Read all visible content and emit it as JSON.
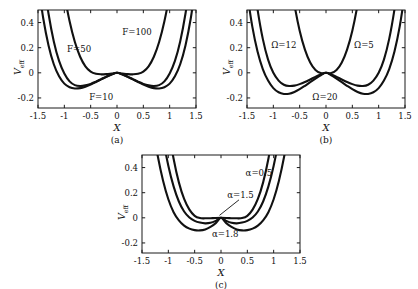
{
  "figure": {
    "background_color": "#ffffff",
    "curve_color": "#111111",
    "axis_color": "#1a1a1a",
    "xlabel": "X",
    "ylabel_main": "V",
    "ylabel_sub": "eff"
  },
  "chart_data": [
    {
      "type": "line",
      "panel": "a",
      "caption": "(a)",
      "title": "",
      "xlabel": "X",
      "ylabel": "V_eff",
      "xlim": [
        -1.5,
        1.5
      ],
      "ylim": [
        -0.28,
        0.5
      ],
      "xticks": [
        -1.5,
        -1,
        -0.5,
        0,
        0.5,
        1,
        1.5
      ],
      "xticklabels": [
        "-1.5",
        "-1",
        "-0.5",
        "0",
        "0.5",
        "1",
        "1.5"
      ],
      "yticks": [
        -0.2,
        0,
        0.2,
        0.4
      ],
      "yticklabels": [
        "-0.2",
        "0",
        "0.2",
        "0.4"
      ],
      "grid": false,
      "legend_position": "inline-annotations",
      "annotations": [
        {
          "text": "F=100",
          "x": 0.38,
          "y": 0.3
        },
        {
          "text": "F=50",
          "x": -0.72,
          "y": 0.165
        },
        {
          "text": "F=10",
          "x": -0.3,
          "y": -0.215
        }
      ],
      "series": [
        {
          "name": "F=10",
          "well_depth": -0.232,
          "well_position": 0.9,
          "x": [
            -1.5,
            -1.4,
            -1.3,
            -1.2,
            -1.1,
            -1.0,
            -0.9,
            -0.8,
            -0.7,
            -0.6,
            -0.5,
            -0.4,
            -0.3,
            -0.2,
            -0.1,
            0.0,
            0.1,
            0.2,
            0.3,
            0.4,
            0.5,
            0.6,
            0.7,
            0.8,
            0.9,
            1.0,
            1.1,
            1.2,
            1.3,
            1.4,
            1.5
          ],
          "values": [
            0.72,
            0.432,
            0.218,
            0.068,
            -0.028,
            -0.086,
            -0.115,
            -0.125,
            -0.122,
            -0.11,
            -0.093,
            -0.073,
            -0.052,
            -0.031,
            -0.013,
            0.0,
            -0.013,
            -0.031,
            -0.052,
            -0.073,
            -0.093,
            -0.11,
            -0.122,
            -0.125,
            -0.115,
            -0.086,
            -0.028,
            0.068,
            0.218,
            0.432,
            0.72
          ]
        },
        {
          "name": "F=50",
          "well_depth": -0.105,
          "well_position": 0.8,
          "x": [
            -1.5,
            -1.4,
            -1.3,
            -1.2,
            -1.1,
            -1.0,
            -0.9,
            -0.8,
            -0.7,
            -0.6,
            -0.5,
            -0.4,
            -0.3,
            -0.2,
            -0.1,
            0.0,
            0.1,
            0.2,
            0.3,
            0.4,
            0.5,
            0.6,
            0.7,
            0.8,
            0.9,
            1.0,
            1.1,
            1.2,
            1.3,
            1.4,
            1.5
          ],
          "values": [
            1.12,
            0.76,
            0.47,
            0.25,
            0.095,
            -0.005,
            -0.068,
            -0.098,
            -0.105,
            -0.1,
            -0.088,
            -0.07,
            -0.05,
            -0.03,
            -0.012,
            0.0,
            -0.012,
            -0.03,
            -0.05,
            -0.07,
            -0.088,
            -0.1,
            -0.105,
            -0.098,
            -0.068,
            -0.005,
            0.095,
            0.25,
            0.47,
            0.76,
            1.12
          ]
        },
        {
          "name": "F=100",
          "well_depth": -0.012,
          "well_position": 0.45,
          "x": [
            -1.5,
            -1.4,
            -1.3,
            -1.2,
            -1.1,
            -1.0,
            -0.9,
            -0.8,
            -0.7,
            -0.6,
            -0.5,
            -0.4,
            -0.3,
            -0.2,
            -0.1,
            0.0,
            0.1,
            0.2,
            0.3,
            0.4,
            0.5,
            0.6,
            0.7,
            0.8,
            0.9,
            1.0,
            1.1,
            1.2,
            1.3,
            1.4,
            1.5
          ],
          "values": [
            2.6,
            2.1,
            1.65,
            1.25,
            0.91,
            0.63,
            0.41,
            0.245,
            0.128,
            0.052,
            0.01,
            -0.008,
            -0.012,
            -0.01,
            -0.005,
            0.0,
            -0.005,
            -0.01,
            -0.012,
            -0.008,
            0.01,
            0.052,
            0.128,
            0.245,
            0.41,
            0.63,
            0.91,
            1.25,
            1.65,
            2.1,
            2.6
          ]
        }
      ]
    },
    {
      "type": "line",
      "panel": "b",
      "caption": "(b)",
      "title": "",
      "xlabel": "X",
      "ylabel": "V_eff",
      "xlim": [
        -1.5,
        1.5
      ],
      "ylim": [
        -0.28,
        0.5
      ],
      "xticks": [
        -1.5,
        -1,
        -0.5,
        0,
        0.5,
        1,
        1.5
      ],
      "xticklabels": [
        "-1.5",
        "-1",
        "-0.5",
        "0",
        "0.5",
        "1",
        "1.5"
      ],
      "yticks": [
        -0.2,
        0,
        0.2,
        0.4
      ],
      "yticklabels": [
        "-0.2",
        "0",
        "0.2",
        "0.4"
      ],
      "grid": false,
      "legend_position": "inline-annotations",
      "annotations": [
        {
          "text": "Ω=12",
          "x": -0.8,
          "y": 0.195
        },
        {
          "text": "Ω=5",
          "x": 0.72,
          "y": 0.195
        },
        {
          "text": "Ω=20",
          "x": -0.02,
          "y": -0.215
        }
      ],
      "series": [
        {
          "name": "Ω=5",
          "well_depth": -0.228,
          "well_position": 0.93,
          "x": [
            -1.5,
            -1.4,
            -1.3,
            -1.2,
            -1.1,
            -1.0,
            -0.9,
            -0.8,
            -0.7,
            -0.6,
            -0.5,
            -0.4,
            -0.3,
            -0.2,
            -0.1,
            0.0,
            0.1,
            0.2,
            0.3,
            0.4,
            0.5,
            0.6,
            0.7,
            0.8,
            0.9,
            1.0,
            1.1,
            1.2,
            1.3,
            1.4,
            1.5
          ],
          "values": [
            0.64,
            0.37,
            0.17,
            0.03,
            -0.062,
            -0.122,
            -0.155,
            -0.168,
            -0.166,
            -0.152,
            -0.13,
            -0.103,
            -0.074,
            -0.046,
            -0.02,
            0.0,
            -0.02,
            -0.046,
            -0.074,
            -0.103,
            -0.13,
            -0.152,
            -0.166,
            -0.168,
            -0.155,
            -0.122,
            -0.062,
            0.03,
            0.17,
            0.37,
            0.64
          ]
        },
        {
          "name": "Ω=12",
          "well_depth": -0.105,
          "well_position": 0.78,
          "x": [
            -1.5,
            -1.4,
            -1.3,
            -1.2,
            -1.1,
            -1.0,
            -0.9,
            -0.8,
            -0.7,
            -0.6,
            -0.5,
            -0.4,
            -0.3,
            -0.2,
            -0.1,
            0.0,
            0.1,
            0.2,
            0.3,
            0.4,
            0.5,
            0.6,
            0.7,
            0.8,
            0.9,
            1.0,
            1.1,
            1.2,
            1.3,
            1.4,
            1.5
          ],
          "values": [
            1.18,
            0.81,
            0.505,
            0.27,
            0.105,
            0.0,
            -0.062,
            -0.095,
            -0.105,
            -0.102,
            -0.09,
            -0.073,
            -0.053,
            -0.032,
            -0.013,
            0.0,
            -0.013,
            -0.032,
            -0.053,
            -0.073,
            -0.09,
            -0.102,
            -0.105,
            -0.095,
            -0.062,
            0.0,
            0.105,
            0.27,
            0.505,
            0.81,
            1.18
          ]
        },
        {
          "name": "Ω=20",
          "well_depth": -0.004,
          "well_position": 0.22,
          "x": [
            -1.5,
            -1.4,
            -1.3,
            -1.2,
            -1.1,
            -1.0,
            -0.9,
            -0.8,
            -0.7,
            -0.6,
            -0.5,
            -0.4,
            -0.3,
            -0.2,
            -0.1,
            0.0,
            0.1,
            0.2,
            0.3,
            0.4,
            0.5,
            0.6,
            0.7,
            0.8,
            0.9,
            1.0,
            1.1,
            1.2,
            1.3,
            1.4,
            1.5
          ],
          "values": [
            6.2,
            5.2,
            4.3,
            3.5,
            2.78,
            2.15,
            1.62,
            1.18,
            0.82,
            0.545,
            0.335,
            0.185,
            0.082,
            0.022,
            -0.002,
            0.0,
            -0.002,
            0.022,
            0.082,
            0.185,
            0.335,
            0.545,
            0.82,
            1.18,
            1.62,
            2.15,
            2.78,
            3.5,
            4.3,
            5.2,
            6.2
          ]
        }
      ]
    },
    {
      "type": "line",
      "panel": "c",
      "caption": "(c)",
      "title": "",
      "xlabel": "X",
      "ylabel": "V_eff",
      "xlim": [
        -1.5,
        1.5
      ],
      "ylim": [
        -0.28,
        0.5
      ],
      "xticks": [
        -1.5,
        -1,
        -0.5,
        0,
        0.5,
        1,
        1.5
      ],
      "xticklabels": [
        "-1.5",
        "-1",
        "-0.5",
        "0",
        "0.5",
        "1",
        "1.5"
      ],
      "yticks": [
        -0.2,
        0,
        0.2,
        0.4
      ],
      "yticklabels": [
        "-0.2",
        "0",
        "0.2",
        "0.4"
      ],
      "grid": false,
      "legend_position": "inline-annotations",
      "annotations": [
        {
          "text": "α=0.5",
          "x": 0.72,
          "y": 0.335
        },
        {
          "text": "α=1.5",
          "x": 0.37,
          "y": 0.155,
          "leader": true
        },
        {
          "text": "α=1.8",
          "x": 0.08,
          "y": -0.155
        }
      ],
      "series": [
        {
          "name": "α=0.5",
          "well_depth": -0.004,
          "well_position": 0.3,
          "x": [
            -1.5,
            -1.4,
            -1.3,
            -1.2,
            -1.1,
            -1.0,
            -0.9,
            -0.8,
            -0.7,
            -0.6,
            -0.5,
            -0.4,
            -0.3,
            -0.2,
            -0.1,
            0.0,
            0.1,
            0.2,
            0.3,
            0.4,
            0.5,
            0.6,
            0.7,
            0.8,
            0.9,
            1.0,
            1.1,
            1.2,
            1.3,
            1.4,
            1.5
          ],
          "values": [
            2.95,
            2.38,
            1.87,
            1.42,
            1.04,
            0.72,
            0.47,
            0.282,
            0.15,
            0.065,
            0.016,
            -0.002,
            -0.004,
            -0.003,
            -0.001,
            0.0,
            -0.001,
            -0.003,
            -0.004,
            -0.002,
            0.016,
            0.065,
            0.15,
            0.282,
            0.47,
            0.72,
            1.04,
            1.42,
            1.87,
            2.38,
            2.95
          ]
        },
        {
          "name": "α=1.5",
          "well_depth": -0.048,
          "well_position": 0.6,
          "x": [
            -1.5,
            -1.4,
            -1.3,
            -1.2,
            -1.1,
            -1.0,
            -0.9,
            -0.8,
            -0.7,
            -0.6,
            -0.5,
            -0.4,
            -0.3,
            -0.2,
            -0.1,
            0.0,
            0.1,
            0.2,
            0.3,
            0.4,
            0.5,
            0.6,
            0.7,
            0.8,
            0.9,
            1.0,
            1.1,
            1.2,
            1.3,
            1.4,
            1.5
          ],
          "values": [
            2.0,
            1.58,
            1.21,
            0.895,
            0.63,
            0.415,
            0.25,
            0.13,
            0.05,
            0.002,
            -0.024,
            -0.038,
            -0.044,
            -0.04,
            -0.024,
            0.0,
            -0.024,
            -0.04,
            -0.044,
            -0.038,
            -0.024,
            0.002,
            0.05,
            0.13,
            0.25,
            0.415,
            0.63,
            0.895,
            1.21,
            1.58,
            2.0
          ]
        },
        {
          "name": "α=1.8",
          "well_depth": -0.102,
          "well_position": 0.72,
          "x": [
            -1.5,
            -1.4,
            -1.3,
            -1.2,
            -1.1,
            -1.0,
            -0.9,
            -0.8,
            -0.7,
            -0.6,
            -0.5,
            -0.4,
            -0.3,
            -0.2,
            -0.1,
            0.0,
            0.1,
            0.2,
            0.3,
            0.4,
            0.5,
            0.6,
            0.7,
            0.8,
            0.9,
            1.0,
            1.1,
            1.2,
            1.3,
            1.4,
            1.5
          ],
          "values": [
            1.38,
            1.03,
            0.735,
            0.49,
            0.295,
            0.148,
            0.045,
            -0.02,
            -0.062,
            -0.086,
            -0.098,
            -0.1,
            -0.092,
            -0.072,
            -0.042,
            0.0,
            -0.042,
            -0.072,
            -0.092,
            -0.1,
            -0.098,
            -0.086,
            -0.062,
            -0.02,
            0.045,
            0.148,
            0.295,
            0.49,
            0.735,
            1.03,
            1.38
          ]
        }
      ]
    }
  ]
}
